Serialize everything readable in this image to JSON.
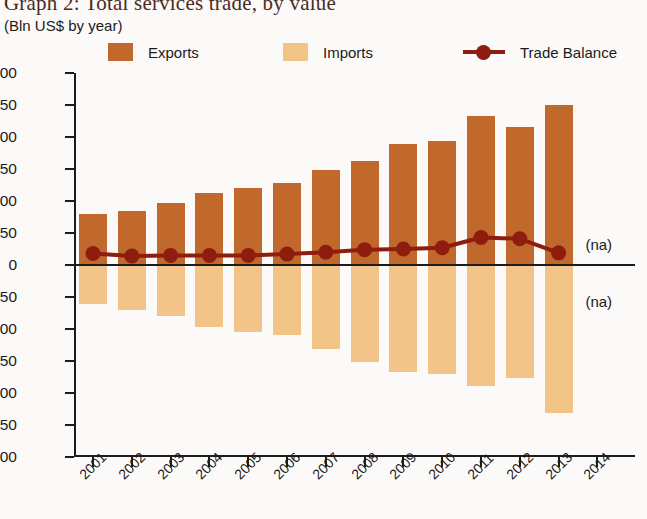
{
  "title": "Graph 2: Total services trade, by value",
  "subtitle": "(Bln US$ by year)",
  "colors": {
    "exports": "#c1682c",
    "imports": "#f2c487",
    "balance": "#8e1d10",
    "axis": "#1c1c1c",
    "text": "#1b1b1b"
  },
  "legend": [
    {
      "label": "Exports",
      "kind": "swatch",
      "color": "#c1682c"
    },
    {
      "label": "Imports",
      "kind": "swatch",
      "color": "#f2c487"
    },
    {
      "label": "Trade Balance",
      "kind": "line",
      "color": "#8e1d10"
    }
  ],
  "annotations": [
    {
      "text": "(na)",
      "series": "Exports"
    },
    {
      "text": "(na)",
      "series": "Imports"
    }
  ],
  "chart_data": {
    "type": "bar",
    "title": "Graph 2: Total services trade, by value",
    "subtitle": "(Bln US$ by year)",
    "xlabel": "",
    "ylabel": "(Bln US$ by year)",
    "ylim": [
      -300,
      300
    ],
    "ytick_values": [
      300,
      250,
      200,
      150,
      100,
      50,
      0,
      -50,
      -100,
      -150,
      -200,
      -250,
      -300
    ],
    "ytick_labels": [
      "300",
      "250",
      "200",
      "150",
      "100",
      "50",
      "0",
      "−50",
      "−100",
      "−150",
      "−200",
      "−250",
      "−300"
    ],
    "grid": false,
    "legend_position": "top",
    "categories": [
      "2001",
      "2002",
      "2003",
      "2004",
      "2005",
      "2006",
      "2007",
      "2008",
      "2009",
      "2010",
      "2011",
      "2012",
      "2013",
      "2014"
    ],
    "xtick_labels": [
      "2001",
      "2002",
      "2003",
      "2004",
      "2005",
      "2006",
      "2007",
      "2008",
      "2009",
      "2010",
      "2011",
      "2012",
      "2013",
      "2014"
    ],
    "series": [
      {
        "name": "Exports",
        "type": "bar",
        "color": "#c1682c",
        "values": [
          80,
          85,
          97,
          113,
          120,
          128,
          149,
          163,
          189,
          194,
          233,
          215,
          250,
          null
        ]
      },
      {
        "name": "Imports",
        "type": "bar",
        "color": "#f2c487",
        "values": [
          -61,
          -70,
          -79,
          -97,
          -105,
          -110,
          -131,
          -152,
          -167,
          -170,
          -189,
          -177,
          -231,
          null
        ]
      },
      {
        "name": "Trade Balance",
        "type": "line",
        "color": "#8e1d10",
        "values": [
          18,
          14,
          15,
          15,
          15,
          17,
          20,
          24,
          25,
          27,
          43,
          41,
          19,
          null
        ]
      }
    ]
  }
}
